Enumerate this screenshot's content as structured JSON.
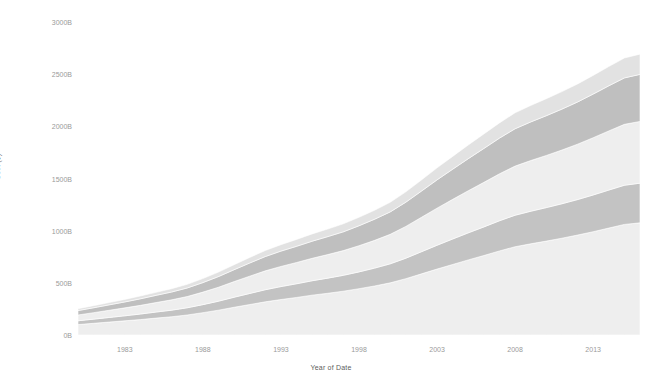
{
  "chart_data": {
    "type": "area",
    "stacked": true,
    "title": "",
    "xlabel": "Year of Date",
    "ylabel": "Cost ($)",
    "xlim": [
      1980,
      2016
    ],
    "ylim": [
      0,
      3000
    ],
    "y_unit": "B",
    "grid": false,
    "legend": "none",
    "x_tick_labels": [
      "1983",
      "1988",
      "1993",
      "1998",
      "2003",
      "2008",
      "2013"
    ],
    "x_tick_values": [
      1983,
      1988,
      1993,
      1998,
      2003,
      2008,
      2013
    ],
    "y_tick_labels": [
      "0B",
      "500B",
      "1000B",
      "1500B",
      "2000B",
      "2500B",
      "3000B"
    ],
    "y_tick_values": [
      0,
      500,
      1000,
      1500,
      2000,
      2500,
      3000
    ],
    "x": [
      1980,
      1981,
      1982,
      1983,
      1984,
      1985,
      1986,
      1987,
      1988,
      1989,
      1990,
      1991,
      1992,
      1993,
      1994,
      1995,
      1996,
      1997,
      1998,
      1999,
      2000,
      2001,
      2002,
      2003,
      2004,
      2005,
      2006,
      2007,
      2008,
      2009,
      2010,
      2011,
      2012,
      2013,
      2014,
      2015,
      2016
    ],
    "series": [
      {
        "name": "Series 1",
        "color": "#eeeeee",
        "values": [
          100,
          112,
          124,
          136,
          148,
          162,
          175,
          192,
          214,
          238,
          266,
          292,
          318,
          340,
          360,
          382,
          400,
          420,
          444,
          470,
          500,
          540,
          586,
          632,
          676,
          720,
          762,
          806,
          846,
          874,
          900,
          928,
          958,
          990,
          1025,
          1060,
          1075
        ]
      },
      {
        "name": "Series 2",
        "color": "#c3c3c3",
        "values": [
          36,
          40,
          44,
          48,
          53,
          58,
          63,
          69,
          77,
          86,
          96,
          106,
          116,
          124,
          131,
          138,
          145,
          152,
          161,
          171,
          182,
          196,
          212,
          228,
          244,
          259,
          274,
          289,
          302,
          312,
          321,
          330,
          340,
          352,
          364,
          375,
          380
        ]
      },
      {
        "name": "Series 3",
        "color": "#eeeeee",
        "values": [
          56,
          62,
          69,
          76,
          83,
          91,
          99,
          108,
          120,
          134,
          150,
          166,
          181,
          193,
          204,
          215,
          226,
          237,
          251,
          266,
          283,
          305,
          330,
          356,
          380,
          404,
          427,
          450,
          471,
          486,
          500,
          515,
          531,
          549,
          567,
          584,
          592
        ]
      },
      {
        "name": "Series 4",
        "color": "#bfbfbf",
        "values": [
          42,
          47,
          52,
          57,
          63,
          69,
          75,
          82,
          91,
          102,
          114,
          126,
          137,
          147,
          155,
          164,
          172,
          180,
          191,
          203,
          215,
          232,
          251,
          271,
          289,
          307,
          325,
          342,
          358,
          370,
          381,
          392,
          404,
          418,
          432,
          445,
          451
        ]
      },
      {
        "name": "Series 5",
        "color": "#e2e2e2",
        "values": [
          18,
          20,
          22,
          24,
          27,
          29,
          32,
          35,
          39,
          43,
          48,
          53,
          58,
          62,
          66,
          70,
          73,
          77,
          81,
          86,
          92,
          99,
          107,
          115,
          123,
          131,
          139,
          146,
          153,
          158,
          163,
          168,
          173,
          179,
          185,
          191,
          194
        ]
      }
    ],
    "totals_note": "Stacked totals rise from about 252B in 1980 to about 2692B in 2016"
  },
  "axes": {
    "y_title": "Cost ($)",
    "x_title": "Year of Date"
  }
}
